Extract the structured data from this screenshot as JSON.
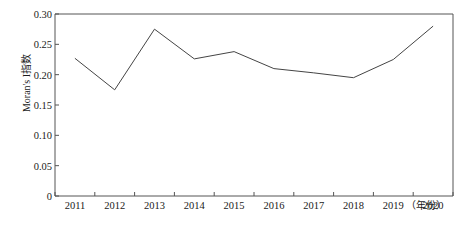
{
  "chart_data": {
    "type": "line",
    "title": "",
    "xlabel": "（年份）",
    "ylabel": "Moran's I指数",
    "categories": [
      "2011",
      "2012",
      "2013",
      "2014",
      "2015",
      "2016",
      "2017",
      "2018",
      "2019",
      "2020"
    ],
    "x": [
      2011,
      2012,
      2013,
      2014,
      2015,
      2016,
      2017,
      2018,
      2019,
      2020
    ],
    "values": [
      0.227,
      0.175,
      0.275,
      0.226,
      0.238,
      0.21,
      0.203,
      0.195,
      0.225,
      0.28
    ],
    "series": [
      {
        "name": "Moran's I指数",
        "values": [
          0.227,
          0.175,
          0.275,
          0.226,
          0.238,
          0.21,
          0.203,
          0.195,
          0.225,
          0.28
        ],
        "color": "#444444"
      }
    ],
    "ylim": [
      0,
      0.3
    ],
    "ytick_labels": [
      "0",
      "0.05",
      "0.10",
      "0.15",
      "0.20",
      "0.25",
      "0.30"
    ],
    "ytick_values": [
      0,
      0.05,
      0.1,
      0.15,
      0.2,
      0.25,
      0.3
    ],
    "xtick_labels": [
      "2011",
      "2012",
      "2013",
      "2014",
      "2015",
      "2016",
      "2017",
      "2018",
      "2019",
      "2020"
    ],
    "grid": false,
    "legend": "none",
    "line_color": "#444444",
    "axis_color": "#555555",
    "background": "#ffffff"
  }
}
